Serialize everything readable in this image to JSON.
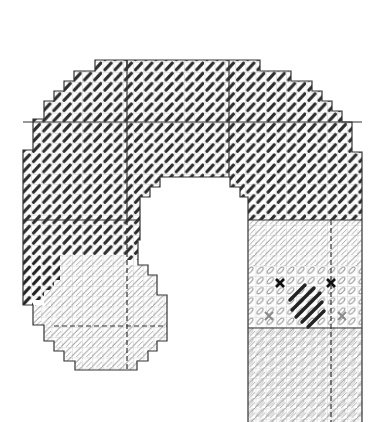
{
  "diagram": {
    "type": "needlepoint-stitch-chart",
    "grid": {
      "cell_px": 10.2,
      "line_color": "#b8b8b8",
      "outline_color": "#333333",
      "center_line": "dashed"
    },
    "colors": {
      "dark_stitch": "#222222",
      "light_stitch": "#9a9a9a",
      "outline": "#333333",
      "grid": "#c4c4c4",
      "cross_dark": "#111111",
      "cross_grey": "#8a8a8a"
    },
    "regions": [
      {
        "name": "arch",
        "stitch": "dark-diagonal"
      },
      {
        "name": "lower-left-circle",
        "stitch": "light-diagonal"
      },
      {
        "name": "right-column",
        "stitch": "light-diagonal"
      },
      {
        "name": "right-column-accent",
        "stitch": "dark-diagonal-long"
      }
    ],
    "markers": [
      {
        "kind": "cross-dark",
        "x": 280,
        "y": 283
      },
      {
        "kind": "cross-dark",
        "x": 331,
        "y": 283
      },
      {
        "kind": "cross-grey",
        "x": 269,
        "y": 316
      },
      {
        "kind": "cross-grey",
        "x": 342,
        "y": 316
      }
    ]
  }
}
